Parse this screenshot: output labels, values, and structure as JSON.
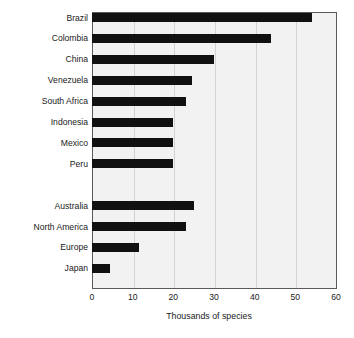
{
  "chart_data": {
    "type": "bar",
    "orientation": "horizontal",
    "title": "",
    "xlabel": "Thousands of species",
    "ylabel": "",
    "xlim": [
      0,
      60
    ],
    "xticks": [
      0,
      10,
      20,
      30,
      40,
      50,
      60
    ],
    "grid": true,
    "legend": "none",
    "bar_color": "#111111",
    "plot_background": "#f2f2f2",
    "gridline_color": "#d2d2d2",
    "axis_color": "#5a5a5a",
    "groups": [
      {
        "name": "countries",
        "categories": [
          "Brazil",
          "Colombia",
          "China",
          "Venezuela",
          "South Africa",
          "Indonesia",
          "Mexico",
          "Peru"
        ],
        "values": [
          54,
          44,
          30,
          24.5,
          23,
          20,
          20,
          20
        ]
      },
      {
        "name": "regions",
        "categories": [
          "Australia",
          "North America",
          "Europe",
          "Japan"
        ],
        "values": [
          25,
          23,
          11.5,
          4.5
        ]
      }
    ],
    "categories": [
      "Brazil",
      "Colombia",
      "China",
      "Venezuela",
      "South Africa",
      "Indonesia",
      "Mexico",
      "Peru",
      "",
      "Australia",
      "North America",
      "Europe",
      "Japan"
    ],
    "values": [
      54,
      44,
      30,
      24.5,
      23,
      20,
      20,
      20,
      null,
      25,
      23,
      11.5,
      4.5
    ]
  },
  "axis": {
    "x_tick_labels": [
      "0",
      "10",
      "20",
      "30",
      "40",
      "50",
      "60"
    ],
    "x_title": "Thousands of species"
  }
}
